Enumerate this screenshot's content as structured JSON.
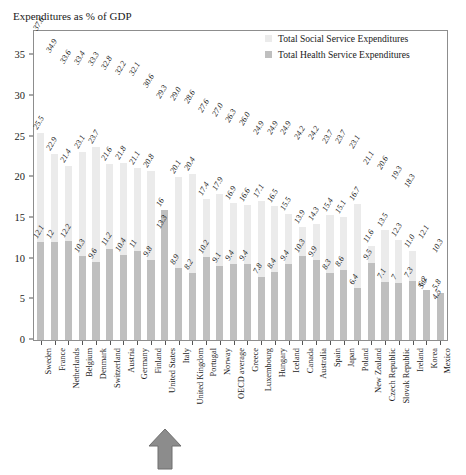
{
  "chart": {
    "title": "Expenditures as % of GDP",
    "legend": [
      {
        "label": "Total Social Service Expenditures",
        "color": "#ebebeb",
        "key": "social"
      },
      {
        "label": "Total Health Service Expenditures",
        "color": "#bfbfbf",
        "key": "health"
      }
    ],
    "annotation": {
      "name": "up-arrow",
      "points_to": "United States",
      "color": "#8c8c8c"
    }
  },
  "chart_data": {
    "type": "bar",
    "title": "Expenditures as % of GDP",
    "xlabel": "",
    "ylabel": "",
    "ylim": [
      0,
      38
    ],
    "yticks": [
      0,
      5,
      10,
      15,
      20,
      25,
      30,
      35
    ],
    "ytick_labels": [
      "0",
      "5",
      "10",
      "15",
      "20",
      "25",
      "30",
      "35"
    ],
    "grid": false,
    "legend_position": "top-right",
    "overlap": "overlay",
    "categories": [
      "Sweden",
      "France",
      "Netherlands",
      "Belgium",
      "Denmark",
      "Switzerland",
      "Austria",
      "Germany",
      "Finland",
      "United States",
      "Italy",
      "United Kingdom",
      "Portugal",
      "Norway",
      "OECD average",
      "Greece",
      "Luxembourg",
      "Hungary",
      "Iceland",
      "Canada",
      "Australia",
      "Spain",
      "Japan",
      "Poland",
      "New Zealand",
      "Czech Republic",
      "Slovak Republic",
      "Ireland",
      "Korea",
      "Mexico"
    ],
    "series": [
      {
        "name": "Total Social Service Expenditures",
        "color": "#ebebeb",
        "values": [
          25.5,
          22.9,
          21.4,
          23.1,
          23.7,
          21.6,
          21.8,
          21.1,
          20.8,
          13.3,
          20.1,
          20.4,
          17.4,
          17.9,
          16.9,
          16.6,
          17.1,
          16.5,
          15.5,
          13.9,
          14.3,
          15.4,
          15.1,
          16.7,
          11.6,
          13.5,
          12.3,
          11.0,
          5.9,
          4.5
        ]
      },
      {
        "name": "Total Health Service Expenditures",
        "color": "#bfbfbf",
        "values": [
          12.1,
          12.0,
          12.2,
          10.3,
          9.6,
          11.2,
          10.4,
          11.0,
          9.8,
          16.0,
          8.9,
          8.2,
          10.2,
          9.1,
          9.4,
          9.4,
          7.8,
          8.4,
          9.4,
          10.3,
          9.9,
          8.3,
          8.6,
          6.4,
          9.5,
          7.1,
          7.0,
          7.3,
          6.2,
          5.8
        ]
      },
      {
        "name": "Total Expenditures",
        "color": "none",
        "values": [
          37.6,
          34.9,
          33.6,
          33.4,
          33.3,
          32.8,
          32.2,
          32.1,
          30.6,
          29.3,
          29.0,
          28.6,
          27.6,
          27.0,
          26.3,
          26.0,
          24.9,
          24.9,
          24.9,
          24.2,
          24.2,
          23.7,
          23.7,
          23.1,
          21.1,
          20.6,
          19.3,
          18.3,
          12.1,
          10.3
        ]
      }
    ],
    "social_labels": [
      "25.5",
      "22.9",
      "21.4",
      "23.1",
      "23.7",
      "21.6",
      "21.8",
      "21.1",
      "20.8",
      "13.3",
      "20.1",
      "20.4",
      "17.4",
      "17.9",
      "16.9",
      "16.6",
      "17.1",
      "16.5",
      "15.5",
      "13.9",
      "14.3",
      "15.4",
      "15.1",
      "16.7",
      "11.6",
      "13.5",
      "12.3",
      "11.0",
      "5.9",
      "4.5"
    ],
    "health_labels": [
      "12.1",
      "12",
      "12.2",
      "10.3",
      "9.6",
      "11.2",
      "10.4",
      "11",
      "9.8",
      "16",
      "8.9",
      "8.2",
      "10.2",
      "9.1",
      "9.4",
      "9.4",
      "7.8",
      "8.4",
      "9.4",
      "10.3",
      "9.9",
      "8.3",
      "8.6",
      "6.4",
      "9.5",
      "7.1",
      "7",
      "7.3",
      "6.2",
      "5.8"
    ],
    "total_labels": [
      "37.6",
      "34.9",
      "33.6",
      "33.4",
      "33.3",
      "32.8",
      "32.2",
      "32.1",
      "30.6",
      "29.3",
      "29.0",
      "28.6",
      "27.6",
      "27.0",
      "26.3",
      "26.0",
      "24.9",
      "24.9",
      "24.9",
      "24.2",
      "24.2",
      "23.7",
      "23.7",
      "23.1",
      "21.1",
      "20.6",
      "19.3",
      "18.3",
      "12.1",
      "10.3"
    ]
  }
}
